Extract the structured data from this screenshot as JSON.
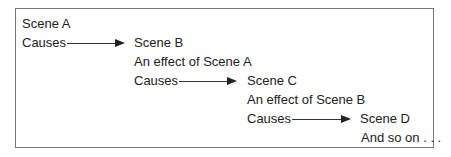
{
  "diagram": {
    "lines": [
      {
        "text": "Scene A"
      },
      {
        "text": "Causes"
      },
      {
        "text": "Scene B"
      },
      {
        "text": "An effect of Scene A"
      },
      {
        "text": "Causes"
      },
      {
        "text": "Scene C"
      },
      {
        "text": "An effect of Scene B"
      },
      {
        "text": "Causes"
      },
      {
        "text": "Scene D"
      },
      {
        "text": "And so on . . ."
      }
    ]
  }
}
